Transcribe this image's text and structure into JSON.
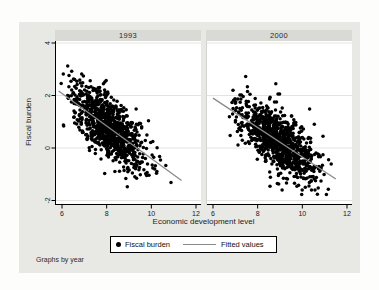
{
  "chart_data": {
    "type": "scatter",
    "facet_by": "year",
    "note": "Graphs by year",
    "xlabel": "Economic development level",
    "ylabel": "Fiscal burden",
    "xticks": [
      6,
      8,
      10,
      12
    ],
    "yticks": [
      -2,
      0,
      2,
      4
    ],
    "xlim": [
      5.7,
      12.2
    ],
    "ylim": [
      -2.17,
      4.08
    ],
    "grid": "horizontal",
    "legend": {
      "items": [
        {
          "marker": "dot-icon",
          "label": "Fiscal burden"
        },
        {
          "marker": "line-icon",
          "label": "Fitted values"
        }
      ]
    },
    "panels": [
      {
        "title": "1993",
        "n_points": 950,
        "seed": 19931,
        "x_mean": 8.1,
        "x_sd": 0.85,
        "x_range": [
          5.95,
          11.1
        ],
        "slope": -0.62,
        "intercept": 5.8,
        "resid_sd": 0.55,
        "y_range": [
          -2.05,
          3.75
        ],
        "fit_x_range": [
          5.85,
          11.35
        ]
      },
      {
        "title": "2000",
        "n_points": 950,
        "seed": 20003,
        "x_mean": 8.95,
        "x_sd": 0.85,
        "x_range": [
          6.3,
          11.6
        ],
        "slope": -0.56,
        "intercept": 5.26,
        "resid_sd": 0.55,
        "y_range": [
          -2.15,
          3.3
        ],
        "fit_x_range": [
          6.0,
          11.5
        ]
      }
    ],
    "colors": {
      "point": "#000000",
      "fit_line": "#8a8a8a",
      "panel_bg": "#ffffff",
      "graph_bg": "#e8e8e4",
      "strip_bg": "#d9d9d5",
      "gridline": "#e3e3e0",
      "axis": "#000000",
      "tick_label": "#1a1a1a"
    }
  }
}
